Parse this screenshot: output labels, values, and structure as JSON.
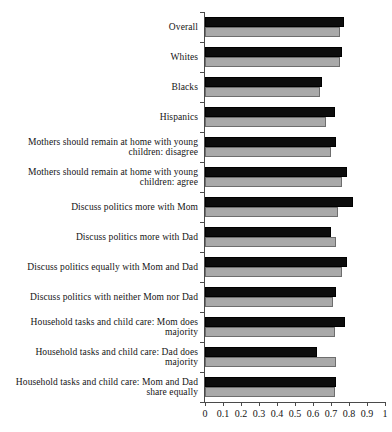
{
  "chart_data": {
    "type": "bar",
    "orientation": "horizontal",
    "title": "",
    "subtitle": "",
    "xlabel": "",
    "ylabel": "",
    "xlim": [
      0,
      1
    ],
    "grid": false,
    "legend": "none",
    "xticks": [
      "0",
      "0.1",
      "0.2",
      "0.3",
      "0.4",
      "0.5",
      "0.6",
      "0.7",
      "0.8",
      "0.9",
      "1"
    ],
    "xtick_values": [
      0,
      0.1,
      0.2,
      0.3,
      0.4,
      0.5,
      0.6,
      0.7,
      0.8,
      0.9,
      1
    ],
    "categories": [
      "Overall",
      "Whites",
      "Blacks",
      "Hispanics",
      "Mothers should remain at home with young children: disagree",
      "Mothers should remain at home with young children: agree",
      "Discuss politics more with Mom",
      "Discuss politics more with Dad",
      "Discuss politics equally with Mom and Dad",
      "Discuss politics with neither Mom nor Dad",
      "Household tasks and child care: Mom does majority",
      "Household tasks and child care: Dad does majority",
      "Household tasks and child care: Mom and Dad share equally"
    ],
    "series": [
      {
        "name": "series-a",
        "color": "#0d0d0d",
        "values": [
          0.77,
          0.76,
          0.65,
          0.72,
          0.73,
          0.79,
          0.82,
          0.7,
          0.79,
          0.73,
          0.78,
          0.62,
          0.73
        ]
      },
      {
        "name": "series-b",
        "color": "#a9a9a9",
        "values": [
          0.75,
          0.75,
          0.64,
          0.67,
          0.7,
          0.76,
          0.74,
          0.73,
          0.76,
          0.71,
          0.72,
          0.73,
          0.72
        ]
      }
    ]
  },
  "colors": {
    "series_a": "#0d0d0d",
    "series_b": "#a9a9a9",
    "axis": "#4a4a4a",
    "text": "#141414",
    "background": "#ffffff"
  }
}
